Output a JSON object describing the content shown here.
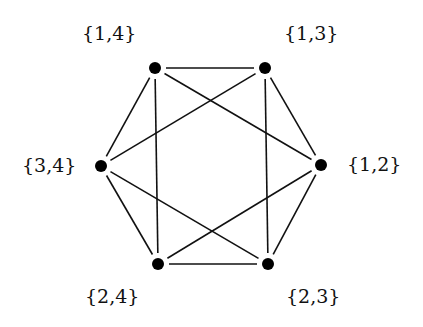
{
  "diagram": {
    "type": "graph",
    "colors": {
      "edge": "#111111",
      "node": "#000000",
      "background": "#ffffff"
    },
    "nodes": [
      {
        "id": "14",
        "label": "{1,4}",
        "x": 155,
        "y": 68,
        "label_x": 82,
        "label_y": 24
      },
      {
        "id": "13",
        "label": "{1,3}",
        "x": 265,
        "y": 68,
        "label_x": 284,
        "label_y": 24
      },
      {
        "id": "34",
        "label": "{3,4}",
        "x": 101,
        "y": 166,
        "label_x": 22,
        "label_y": 156
      },
      {
        "id": "12",
        "label": "{1,2}",
        "x": 321,
        "y": 165,
        "label_x": 347,
        "label_y": 155
      },
      {
        "id": "24",
        "label": "{2,4}",
        "x": 158,
        "y": 264,
        "label_x": 85,
        "label_y": 287
      },
      {
        "id": "23",
        "label": "{2,3}",
        "x": 268,
        "y": 264,
        "label_x": 286,
        "label_y": 287
      }
    ],
    "edges": [
      [
        "14",
        "13"
      ],
      [
        "14",
        "34"
      ],
      [
        "14",
        "24"
      ],
      [
        "14",
        "12"
      ],
      [
        "13",
        "34"
      ],
      [
        "13",
        "12"
      ],
      [
        "13",
        "23"
      ],
      [
        "34",
        "24"
      ],
      [
        "34",
        "23"
      ],
      [
        "12",
        "24"
      ],
      [
        "12",
        "23"
      ],
      [
        "24",
        "23"
      ]
    ]
  }
}
